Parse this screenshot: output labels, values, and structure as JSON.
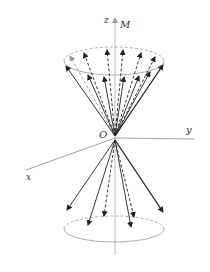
{
  "diagram": {
    "type": "precession-cone",
    "labels": {
      "z_axis": "z",
      "magnetization": "M",
      "origin": "O",
      "y_axis": "y",
      "x_axis": "x"
    },
    "colors": {
      "axis": "#999999",
      "arrow": "#222222",
      "ellipse": "#9a9a9a",
      "text": "#333333"
    },
    "upper_cone": {
      "solid_arrow_count": 7,
      "dashed_arrow_count": 6
    },
    "lower_cone": {
      "solid_arrow_count": 4,
      "dashed_arrow_count": 2
    }
  }
}
